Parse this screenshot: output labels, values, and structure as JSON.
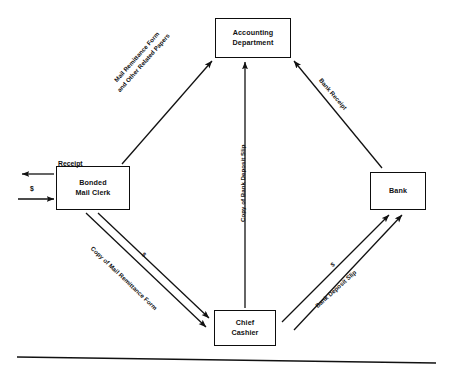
{
  "diagram": {
    "type": "flowchart",
    "nodes": [
      {
        "id": "accounting",
        "label_line1": "Accounting",
        "label_line2": "Department",
        "position": "top"
      },
      {
        "id": "clerk",
        "label_line1": "Bonded",
        "label_line2": "Mail Clerk",
        "position": "left"
      },
      {
        "id": "bank",
        "label_line1": "Bank",
        "label_line2": "",
        "position": "right"
      },
      {
        "id": "cashier",
        "label_line1": "Chief",
        "label_line2": "Cashier",
        "position": "bottom"
      }
    ],
    "edge_labels": {
      "clerk_to_accounting_line1": "Mail Remittance Form",
      "clerk_to_accounting_line2": "and Other Related Papers",
      "bank_to_accounting": "Bank Receipt",
      "cashier_to_accounting_line1": "Copy of Bank Deposit",
      "cashier_to_accounting_line2": "Slip",
      "cashier_to_accounting": "Copy of Bank Deposit Slip",
      "clerk_to_cashier_form": "Copy of Mail Remittance Form",
      "clerk_to_cashier_cash": "$",
      "cashier_to_bank_slip": "Bank Deposit Slip",
      "cashier_to_bank_cash": "$"
    },
    "flow_labels": {
      "receipt_out": "Receipt",
      "cash_in": "$"
    }
  }
}
